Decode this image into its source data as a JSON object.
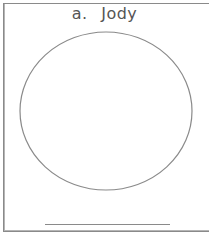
{
  "card": {
    "label": "a.",
    "name": "Jody",
    "shape": "circle",
    "stroke_color": "#8a8a8a"
  }
}
